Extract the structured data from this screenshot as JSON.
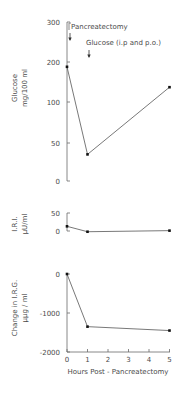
{
  "chart_data": [
    {
      "type": "line",
      "panel": "top",
      "title": "",
      "xlabel": "",
      "ylabel": [
        "Glucose",
        "mg/100 ml"
      ],
      "yticks": [
        "300",
        "200",
        "100",
        "50",
        "0"
      ],
      "yscale_note": "tick labels evenly spaced (non-linear scale)",
      "x": [
        0,
        1,
        5
      ],
      "values": [
        188,
        35,
        137
      ],
      "annotations": [
        {
          "text": "Pancreatectomy",
          "x": 0,
          "arrow": true
        },
        {
          "text": "Glucose (i.p and p.o.)",
          "x": 0.5,
          "arrow": true
        }
      ]
    },
    {
      "type": "line",
      "panel": "middle",
      "title": "",
      "xlabel": "",
      "ylabel": [
        "I.R.I.",
        "μU/ml"
      ],
      "yticks": [
        "50",
        "0"
      ],
      "ylim": [
        0,
        50
      ],
      "x": [
        0,
        1,
        5
      ],
      "values": [
        13,
        -2,
        1
      ]
    },
    {
      "type": "line",
      "panel": "bottom",
      "title": "",
      "xlabel": "Hours Post - Pancreatectomy",
      "ylabel": [
        "Change in I.R.G.",
        "μμg / ml"
      ],
      "yticks": [
        "0",
        "-1000",
        "-2000"
      ],
      "ylim": [
        -2000,
        0
      ],
      "xticks": [
        "0",
        "1",
        "2",
        "3",
        "4",
        "5"
      ],
      "x": [
        0,
        1,
        5
      ],
      "values": [
        0,
        -1350,
        -1450
      ]
    }
  ],
  "labels": {
    "top_ylabel_1": "Glucose",
    "top_ylabel_2": "mg/100 ml",
    "mid_ylabel_1": "I.R.I.",
    "mid_ylabel_2": "μU/ml",
    "bot_ylabel_1": "Change in I.R.G.",
    "bot_ylabel_2": "μμg / ml",
    "xlabel": "Hours Post - Pancreatectomy",
    "annot_pancreatectomy": "Pancreatectomy",
    "annot_glucose": "Glucose (i.p and p.o.)"
  }
}
